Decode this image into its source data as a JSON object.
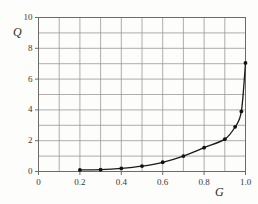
{
  "chart_data": {
    "type": "line",
    "title": "",
    "subtitle": "",
    "xlabel": "G",
    "ylabel": "Q",
    "xlim": [
      0,
      1.0
    ],
    "ylim": [
      0,
      10
    ],
    "xticks": [
      "0",
      "0.2",
      "0.4",
      "0.6",
      "0.8",
      "1.0"
    ],
    "xtick_values": [
      0,
      0.2,
      0.4,
      0.6,
      0.8,
      1.0
    ],
    "yticks": [
      "0",
      "2",
      "4",
      "6",
      "8",
      "10"
    ],
    "ytick_values": [
      0,
      2,
      4,
      6,
      8,
      10
    ],
    "grid": true,
    "grid_x_step": 0.1,
    "grid_y_step": 1,
    "legend": null,
    "series": [
      {
        "name": "Q vs G",
        "marker": "filled-circle",
        "line": "solid",
        "color": "#1a1a1a",
        "points": [
          {
            "x": 0.2,
            "y": 0.1
          },
          {
            "x": 0.3,
            "y": 0.12
          },
          {
            "x": 0.4,
            "y": 0.2
          },
          {
            "x": 0.5,
            "y": 0.35
          },
          {
            "x": 0.6,
            "y": 0.6
          },
          {
            "x": 0.7,
            "y": 1.0
          },
          {
            "x": 0.8,
            "y": 1.55
          },
          {
            "x": 0.9,
            "y": 2.1
          },
          {
            "x": 0.95,
            "y": 2.9
          },
          {
            "x": 0.98,
            "y": 3.9
          },
          {
            "x": 1.0,
            "y": 7.05
          }
        ]
      }
    ],
    "colors": {
      "background": "#fdfdfc",
      "grid": "#999999",
      "frame": "#6b6b6b",
      "curve": "#1a1a1a",
      "marker": "#111111",
      "text": "#2a2a2a"
    }
  }
}
